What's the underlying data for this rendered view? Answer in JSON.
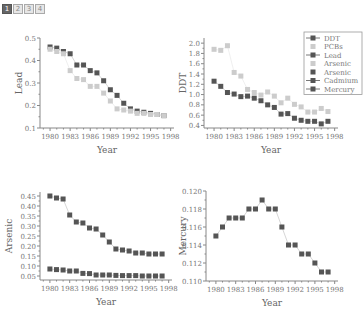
{
  "tabs": [
    {
      "label": "1",
      "active": true
    },
    {
      "label": "2",
      "active": false
    },
    {
      "label": "3",
      "active": false
    },
    {
      "label": "4",
      "active": false
    }
  ],
  "colors": {
    "dark": "#555555",
    "light": "#cccccc",
    "axis": "#888888"
  },
  "chart_data": [
    {
      "type": "scatter",
      "title": "",
      "xlabel": "Year",
      "ylabel": "Lead",
      "x": [
        1980,
        1981,
        1982,
        1983,
        1984,
        1985,
        1986,
        1987,
        1988,
        1989,
        1990,
        1991,
        1992,
        1993,
        1994,
        1995,
        1996,
        1997
      ],
      "xticks": [
        1980,
        1983,
        1986,
        1989,
        1992,
        1995,
        1998
      ],
      "yticks": [
        0.1,
        0.2,
        0.3,
        0.4,
        0.5
      ],
      "xlim": [
        1978.5,
        1998.5
      ],
      "ylim": [
        0.1,
        0.5
      ],
      "series": [
        {
          "name": "Lead (dark)",
          "color": "#555555",
          "values": [
            0.46,
            0.455,
            0.44,
            0.43,
            0.38,
            0.38,
            0.355,
            0.345,
            0.31,
            0.27,
            0.245,
            0.21,
            0.185,
            0.175,
            0.17,
            0.165,
            0.16,
            0.155
          ]
        },
        {
          "name": "Lead (light)",
          "color": "#cccccc",
          "values": [
            0.45,
            0.44,
            0.43,
            0.355,
            0.32,
            0.315,
            0.285,
            0.285,
            0.255,
            0.22,
            0.185,
            0.18,
            0.175,
            0.165,
            0.165,
            0.16,
            0.16,
            0.155
          ]
        }
      ]
    },
    {
      "type": "scatter",
      "title": "",
      "xlabel": "Year",
      "ylabel": "DDT",
      "x": [
        1980,
        1981,
        1982,
        1983,
        1984,
        1985,
        1986,
        1987,
        1988,
        1989,
        1990,
        1991,
        1992,
        1993,
        1994,
        1995,
        1996,
        1997
      ],
      "xticks": [
        1980,
        1983,
        1986,
        1989,
        1992,
        1995,
        1998
      ],
      "yticks": [
        0.4,
        0.6,
        0.8,
        1.0,
        1.2,
        1.4,
        1.6,
        1.8,
        2.0
      ],
      "xlim": [
        1978.5,
        1998.5
      ],
      "ylim": [
        0.35,
        2.1
      ],
      "legend": {
        "position": "top-right",
        "entries": [
          {
            "label": "DDT",
            "style": "dark-line"
          },
          {
            "label": "PCBs",
            "style": "light"
          },
          {
            "label": "Lead",
            "style": "dark-line"
          },
          {
            "label": "Arsenic",
            "style": "light"
          },
          {
            "label": "Arsenic",
            "style": "dark"
          },
          {
            "label": "Cadmium",
            "style": "dark-line"
          },
          {
            "label": "Mercury",
            "style": "dark-line"
          }
        ]
      },
      "series": [
        {
          "name": "DDT",
          "color": "#555555",
          "values": [
            1.26,
            1.16,
            1.04,
            1.01,
            0.96,
            0.97,
            0.93,
            0.88,
            0.8,
            0.75,
            0.62,
            0.63,
            0.54,
            0.5,
            0.48,
            0.48,
            0.43,
            0.48
          ]
        },
        {
          "name": "PCBs",
          "color": "#cccccc",
          "values": [
            1.88,
            1.86,
            1.95,
            1.43,
            1.36,
            1.1,
            1.04,
            0.99,
            1.05,
            0.97,
            0.84,
            0.93,
            0.81,
            0.76,
            0.66,
            0.66,
            0.73,
            0.67
          ]
        }
      ]
    },
    {
      "type": "scatter",
      "title": "",
      "xlabel": "Year",
      "ylabel": "Arsenic",
      "x": [
        1980,
        1981,
        1982,
        1983,
        1984,
        1985,
        1986,
        1987,
        1988,
        1989,
        1990,
        1991,
        1992,
        1993,
        1994,
        1995,
        1996,
        1997
      ],
      "xticks": [
        1980,
        1983,
        1986,
        1989,
        1992,
        1995,
        1998
      ],
      "yticks": [
        0.05,
        0.1,
        0.15,
        0.2,
        0.25,
        0.3,
        0.35,
        0.4,
        0.45
      ],
      "xlim": [
        1978.5,
        1998.5
      ],
      "ylim": [
        0.03,
        0.47
      ],
      "series": [
        {
          "name": "Arsenic (high)",
          "color": "#555555",
          "values": [
            0.45,
            0.44,
            0.435,
            0.355,
            0.32,
            0.315,
            0.29,
            0.285,
            0.255,
            0.22,
            0.185,
            0.18,
            0.175,
            0.165,
            0.165,
            0.16,
            0.16,
            0.16
          ]
        },
        {
          "name": "Arsenic (low)",
          "color": "#555555",
          "values": [
            0.085,
            0.082,
            0.08,
            0.075,
            0.075,
            0.063,
            0.062,
            0.055,
            0.055,
            0.055,
            0.053,
            0.052,
            0.052,
            0.052,
            0.05,
            0.05,
            0.05,
            0.05
          ]
        }
      ]
    },
    {
      "type": "line",
      "title": "",
      "xlabel": "Year",
      "ylabel": "Mercury",
      "x": [
        1980,
        1981,
        1982,
        1983,
        1984,
        1985,
        1986,
        1987,
        1988,
        1989,
        1990,
        1991,
        1992,
        1993,
        1994,
        1995,
        1996,
        1997
      ],
      "xticks": [
        1980,
        1983,
        1986,
        1989,
        1992,
        1995,
        1998
      ],
      "yticks": [
        0.11,
        0.112,
        0.114,
        0.116,
        0.118,
        0.12
      ],
      "xlim": [
        1978.5,
        1998.5
      ],
      "ylim": [
        0.11,
        0.12
      ],
      "series": [
        {
          "name": "Mercury",
          "color": "#555555",
          "values": [
            0.115,
            0.116,
            0.117,
            0.117,
            0.117,
            0.118,
            0.118,
            0.119,
            0.118,
            0.118,
            0.116,
            0.114,
            0.114,
            0.113,
            0.113,
            0.112,
            0.111,
            0.111
          ]
        }
      ]
    }
  ],
  "panels": [
    {
      "id": "lead",
      "box": {
        "left": 22,
        "top": 30,
        "width": 158,
        "height": 135
      },
      "plot": {
        "x0": 18,
        "y0": 8,
        "x1": 152,
        "y1": 98
      },
      "yfmt": 1
    },
    {
      "id": "ddt",
      "box": {
        "left": 180,
        "top": 30,
        "width": 183,
        "height": 135
      },
      "plot": {
        "x0": 24,
        "y0": 8,
        "x1": 158,
        "y1": 98
      },
      "yfmt": 1
    },
    {
      "id": "arsenic",
      "box": {
        "left": 0,
        "top": 188,
        "width": 180,
        "height": 135
      },
      "plot": {
        "x0": 40,
        "y0": 4,
        "x1": 172,
        "y1": 92
      },
      "yfmt": 2
    },
    {
      "id": "mercury",
      "box": {
        "left": 180,
        "top": 188,
        "width": 183,
        "height": 135
      },
      "plot": {
        "x0": 26,
        "y0": 3,
        "x1": 158,
        "y1": 93
      },
      "yfmt": 3
    }
  ]
}
